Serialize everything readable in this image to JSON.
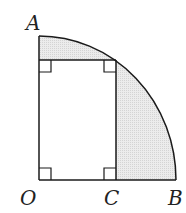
{
  "diagram": {
    "type": "geometry",
    "labels": {
      "A": "A",
      "O": "O",
      "C": "C",
      "B": "B"
    },
    "colors": {
      "stroke": "#1a1a1a",
      "shade": "#e4e4e4",
      "background": "#ffffff"
    }
  }
}
